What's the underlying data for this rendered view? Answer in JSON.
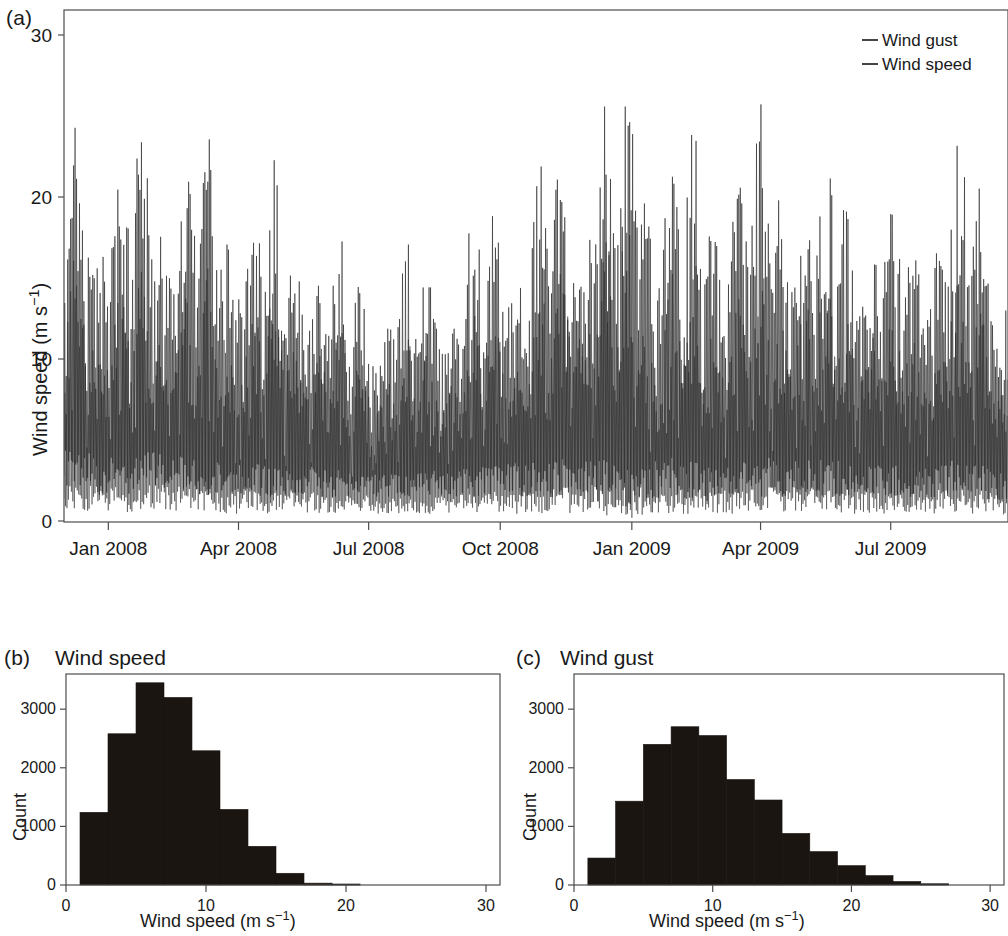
{
  "figure": {
    "background": "#ffffff",
    "ink_color": "#161616"
  },
  "panel_a": {
    "letter": "(a)",
    "y_axis_label_main": "Wind speed (m s",
    "y_axis_label_exponent": "−1",
    "y_axis_label_close": ")",
    "y_ticks": [
      "0",
      "10",
      "20",
      "30"
    ],
    "x_ticks": [
      "Jan 2008",
      "Apr 2008",
      "Jul 2008",
      "Oct 2008",
      "Jan 2009",
      "Apr 2009",
      "Jul 2009"
    ],
    "legend": [
      {
        "label": "Wind gust",
        "color": "#161616"
      },
      {
        "label": "Wind speed",
        "color": "#2b2b2b"
      }
    ]
  },
  "panel_b": {
    "letter": "(b)",
    "heading": "Wind speed",
    "y_axis_label": "Count",
    "x_axis_label_main": "Wind speed (m s",
    "x_axis_label_exponent": "−1",
    "x_axis_label_close": ")",
    "y_ticks": [
      "0",
      "1000",
      "2000",
      "3000"
    ],
    "x_ticks": [
      "0",
      "10",
      "20",
      "30"
    ]
  },
  "panel_c": {
    "letter": "(c)",
    "heading": "Wind gust",
    "y_axis_label": "Count",
    "x_axis_label_main": "Wind speed (m s",
    "x_axis_label_exponent": "−1",
    "x_axis_label_close": ")",
    "y_ticks": [
      "0",
      "1000",
      "2000",
      "3000"
    ],
    "x_ticks": [
      "0",
      "10",
      "20",
      "30"
    ]
  },
  "chart_data": [
    {
      "id": "panel-a-timeseries",
      "type": "line",
      "title": "(a) Wind speed and wind gust time series",
      "xlabel": "",
      "ylabel": "Wind speed (m s-1)",
      "ylim": [
        0,
        31
      ],
      "xlim": [
        0,
        660
      ],
      "x_tick_labels": [
        "Jan 2008",
        "Apr 2008",
        "Jul 2008",
        "Oct 2008",
        "Jan 2009",
        "Apr 2009",
        "Jul 2009"
      ],
      "x_tick_positions_days": [
        31,
        122,
        213,
        305,
        397,
        487,
        578
      ],
      "y_tick_values": [
        0,
        10,
        20,
        30
      ],
      "grid": false,
      "legend_position": "top-right",
      "series": [
        {
          "name": "Wind gust",
          "color": "#161616",
          "description": "Upper envelope trace, high-frequency daily spikes, range approx 2 to 30 m/s, winter maxima near 26-30, summer 2008 lull with maxima near 14-18",
          "envelope_max_by_month": [
            27,
            26,
            25,
            24,
            23,
            21,
            18,
            17,
            18,
            21,
            23,
            27,
            30,
            26,
            25,
            26,
            25,
            22,
            20,
            26,
            19
          ],
          "envelope_min_by_month": [
            2,
            1.5,
            2,
            1.5,
            1.5,
            1.5,
            1.5,
            1.5,
            1.5,
            1.5,
            1.5,
            1.5,
            0.5,
            1.5,
            1,
            1.5,
            1.5,
            1.5,
            1.5,
            1.5,
            1
          ]
        },
        {
          "name": "Wind speed",
          "color": "#2b2b2b",
          "description": "Lower trace beneath gust, typically 60-70 percent of gust magnitude, range approx 0.5 to 19 m/s",
          "envelope_max_by_month": [
            18,
            17,
            16,
            16,
            15,
            14,
            12,
            11,
            12,
            14,
            15,
            18,
            19,
            17,
            16,
            17,
            16,
            15,
            13,
            17,
            13
          ],
          "envelope_min_by_month": [
            0.8,
            0.5,
            0.8,
            0.5,
            0.5,
            0.5,
            0.5,
            0.5,
            0.5,
            0.5,
            0.5,
            0.5,
            0.2,
            0.5,
            0.4,
            0.5,
            0.5,
            0.5,
            0.5,
            0.5,
            0.4
          ]
        }
      ],
      "period_start": "Dec 2007",
      "period_end": "Sep 2009"
    },
    {
      "id": "panel-b-histogram",
      "type": "bar",
      "title": "(b) Wind speed",
      "xlabel": "Wind speed (m s-1)",
      "ylabel": "Count",
      "xlim": [
        0,
        31
      ],
      "ylim": [
        0,
        3600
      ],
      "y_tick_values": [
        0,
        1000,
        2000,
        3000
      ],
      "x_tick_values": [
        0,
        10,
        20,
        30
      ],
      "grid": false,
      "bin_width": 2,
      "bin_edges": [
        1,
        3,
        5,
        7,
        9,
        11,
        13,
        15,
        17,
        19,
        21,
        23,
        25,
        27,
        29
      ],
      "categories": [
        "1-3",
        "3-5",
        "5-7",
        "7-9",
        "9-11",
        "11-13",
        "13-15",
        "15-17",
        "17-19",
        "19-21",
        "21-23",
        "23-25",
        "25-27",
        "27-29"
      ],
      "values": [
        1240,
        2580,
        3450,
        3200,
        2290,
        1290,
        660,
        200,
        30,
        5,
        0,
        0,
        0,
        0
      ]
    },
    {
      "id": "panel-c-histogram",
      "type": "bar",
      "title": "(c) Wind gust",
      "xlabel": "Wind speed (m s-1)",
      "ylabel": "Count",
      "xlim": [
        0,
        31
      ],
      "ylim": [
        0,
        3600
      ],
      "y_tick_values": [
        0,
        1000,
        2000,
        3000
      ],
      "x_tick_values": [
        0,
        10,
        20,
        30
      ],
      "grid": false,
      "bin_width": 2,
      "bin_edges": [
        1,
        3,
        5,
        7,
        9,
        11,
        13,
        15,
        17,
        19,
        21,
        23,
        25,
        27,
        29
      ],
      "categories": [
        "1-3",
        "3-5",
        "5-7",
        "7-9",
        "9-11",
        "11-13",
        "13-15",
        "15-17",
        "17-19",
        "19-21",
        "21-23",
        "23-25",
        "25-27",
        "27-29"
      ],
      "values": [
        460,
        1430,
        2400,
        2700,
        2550,
        1800,
        1450,
        880,
        570,
        330,
        160,
        60,
        20,
        0
      ]
    }
  ]
}
